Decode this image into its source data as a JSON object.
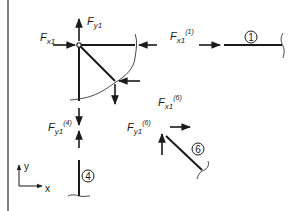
{
  "diagram": {
    "labels": {
      "fx1": {
        "base": "F",
        "sub": "x1",
        "sup": ""
      },
      "fy1": {
        "base": "F",
        "sub": "y1",
        "sup": ""
      },
      "fx1_m1": {
        "base": "F",
        "sub": "x1",
        "sup": "(1)"
      },
      "fy1_m4": {
        "base": "F",
        "sub": "y1",
        "sup": "(4)"
      },
      "fy1_m6": {
        "base": "F",
        "sub": "y1",
        "sup": "(6)"
      },
      "fx1_m6": {
        "base": "F",
        "sub": "x1",
        "sup": "(6)"
      }
    },
    "members": [
      {
        "id": "1",
        "label": "1",
        "orientation": "horizontal"
      },
      {
        "id": "4",
        "label": "4",
        "orientation": "vertical"
      },
      {
        "id": "6",
        "label": "6",
        "orientation": "diagonal"
      }
    ],
    "axes": {
      "x": "x",
      "y": "y"
    },
    "colors": {
      "ink": "#1a1a1a",
      "background": "#ffffff",
      "frame": "#555555"
    }
  }
}
